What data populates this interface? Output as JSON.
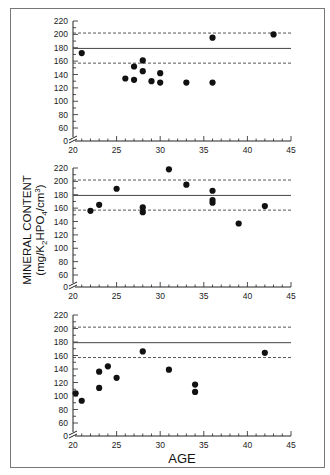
{
  "chart_data": [
    {
      "type": "scatter",
      "panel": "top",
      "title": "",
      "xlabel": "",
      "ylabel": "",
      "xlim": [
        20,
        45
      ],
      "ylim": [
        0,
        220
      ],
      "axis_break": "y axis broken between 0 and 60",
      "x_ticks": [
        20,
        25,
        30,
        35,
        40,
        45
      ],
      "y_ticks": [
        0,
        60,
        80,
        100,
        120,
        140,
        160,
        180,
        200,
        220
      ],
      "reference_lines": [
        {
          "style": "dashed",
          "value": 202
        },
        {
          "style": "solid",
          "value": 179
        },
        {
          "style": "dashed",
          "value": 157
        }
      ],
      "points": [
        {
          "x": 21,
          "y": 172
        },
        {
          "x": 26,
          "y": 134
        },
        {
          "x": 27,
          "y": 132
        },
        {
          "x": 27,
          "y": 152
        },
        {
          "x": 28,
          "y": 161
        },
        {
          "x": 28,
          "y": 145
        },
        {
          "x": 29,
          "y": 130
        },
        {
          "x": 30,
          "y": 142
        },
        {
          "x": 30,
          "y": 128
        },
        {
          "x": 33,
          "y": 128
        },
        {
          "x": 36,
          "y": 128
        },
        {
          "x": 36,
          "y": 195
        },
        {
          "x": 43,
          "y": 200
        }
      ]
    },
    {
      "type": "scatter",
      "panel": "middle",
      "title": "",
      "xlabel": "",
      "ylabel": "MINERAL CONTENT (mg/K2HPO4/cm3)",
      "xlim": [
        20,
        45
      ],
      "ylim": [
        0,
        220
      ],
      "axis_break": "y axis broken between 0 and 60",
      "x_ticks": [
        20,
        25,
        30,
        35,
        40,
        45
      ],
      "y_ticks": [
        0,
        60,
        80,
        100,
        120,
        140,
        160,
        180,
        200,
        220
      ],
      "reference_lines": [
        {
          "style": "dashed",
          "value": 202
        },
        {
          "style": "solid",
          "value": 179
        },
        {
          "style": "dashed",
          "value": 157
        }
      ],
      "points": [
        {
          "x": 22,
          "y": 156
        },
        {
          "x": 23,
          "y": 165
        },
        {
          "x": 25,
          "y": 189
        },
        {
          "x": 28,
          "y": 161
        },
        {
          "x": 28,
          "y": 154
        },
        {
          "x": 31,
          "y": 218
        },
        {
          "x": 33,
          "y": 195
        },
        {
          "x": 36,
          "y": 186
        },
        {
          "x": 36,
          "y": 172
        },
        {
          "x": 36,
          "y": 168
        },
        {
          "x": 39,
          "y": 137
        },
        {
          "x": 42,
          "y": 163
        }
      ]
    },
    {
      "type": "scatter",
      "panel": "bottom",
      "title": "",
      "xlabel": "AGE",
      "ylabel": "",
      "xlim": [
        20,
        45
      ],
      "ylim": [
        0,
        220
      ],
      "axis_break": "y axis broken between 0 and 60",
      "x_ticks": [
        20,
        25,
        30,
        35,
        40,
        45
      ],
      "y_ticks": [
        0,
        60,
        80,
        100,
        120,
        140,
        160,
        180,
        200,
        220
      ],
      "reference_lines": [
        {
          "style": "dashed",
          "value": 202
        },
        {
          "style": "solid",
          "value": 179
        },
        {
          "style": "dashed",
          "value": 157
        }
      ],
      "points": [
        {
          "x": 20.3,
          "y": 104
        },
        {
          "x": 21,
          "y": 93
        },
        {
          "x": 23,
          "y": 136
        },
        {
          "x": 23,
          "y": 112
        },
        {
          "x": 24,
          "y": 144
        },
        {
          "x": 25,
          "y": 127
        },
        {
          "x": 28,
          "y": 166
        },
        {
          "x": 31,
          "y": 139
        },
        {
          "x": 34,
          "y": 117
        },
        {
          "x": 34,
          "y": 106
        },
        {
          "x": 42,
          "y": 164
        }
      ]
    }
  ],
  "labels": {
    "y_axis_line1": "MINERAL CONTENT",
    "y_axis_line2_pre": "(mg/K",
    "y_axis_sub1": "2",
    "y_axis_line2_mid": "HPO",
    "y_axis_sub2": "4",
    "y_axis_line2_post": "/cm",
    "y_axis_sup": "3",
    "y_axis_close": ")",
    "x_axis": "AGE"
  },
  "colors": {
    "points": "#111111",
    "axis": "#222222",
    "reference_line": "#444444",
    "frame": "#777777"
  }
}
